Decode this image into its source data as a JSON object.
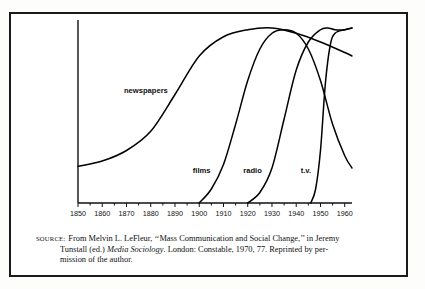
{
  "figure": {
    "caption": {
      "source_label": "Source:",
      "line1_rest": "From Melvin L. LeFleur, ‘‘Mass Communication and Social Change,’’ in Jeremy",
      "line2_pre": "Tunstall (ed.) ",
      "line2_italic": "Media Sociology",
      "line2_post": ". London: Constable, 1970, 77. Reprinted by per-",
      "line3": "mission of the author."
    }
  },
  "chart_data": {
    "type": "line",
    "title": "",
    "xlabel": "",
    "ylabel": "",
    "xlim": [
      1850,
      1963
    ],
    "ylim": [
      0,
      100
    ],
    "grid": false,
    "legend_position": "inline-labels",
    "tick_labels": [
      "1850",
      "1860",
      "1870",
      "1880",
      "1890",
      "1900",
      "1910",
      "1920",
      "1930",
      "1940",
      "1950",
      "1960"
    ],
    "tick_values": [
      1850,
      1860,
      1870,
      1880,
      1890,
      1900,
      1910,
      1920,
      1930,
      1940,
      1950,
      1960
    ],
    "annotations": [
      {
        "text": "newspapers",
        "x": 1878,
        "y": 63
      },
      {
        "text": "films",
        "x": 1901,
        "y": 17
      },
      {
        "text": "radio",
        "x": 1922,
        "y": 17
      },
      {
        "text": "t.v.",
        "x": 1944,
        "y": 17
      }
    ],
    "series": [
      {
        "name": "newspapers",
        "x": [
          1850,
          1860,
          1870,
          1880,
          1890,
          1900,
          1910,
          1920,
          1930,
          1940,
          1950,
          1960,
          1963
        ],
        "y": [
          21,
          24,
          30,
          41,
          62,
          84,
          95,
          99,
          100,
          97,
          92,
          86,
          84
        ]
      },
      {
        "name": "films",
        "x": [
          1900,
          1905,
          1910,
          1915,
          1920,
          1925,
          1930,
          1935,
          1940,
          1945,
          1950,
          1955,
          1960,
          1963
        ],
        "y": [
          0,
          8,
          22,
          45,
          70,
          88,
          97,
          99,
          97,
          88,
          70,
          45,
          27,
          20
        ]
      },
      {
        "name": "radio",
        "x": [
          1920,
          1925,
          1930,
          1935,
          1940,
          1945,
          1950,
          1953,
          1956,
          1960,
          1963
        ],
        "y": [
          0,
          6,
          20,
          48,
          76,
          92,
          99,
          100,
          99,
          99,
          100
        ]
      },
      {
        "name": "t.v.",
        "x": [
          1946,
          1948,
          1950,
          1952,
          1954,
          1956,
          1960,
          1963
        ],
        "y": [
          0,
          8,
          30,
          68,
          90,
          97,
          99,
          100
        ]
      }
    ]
  }
}
